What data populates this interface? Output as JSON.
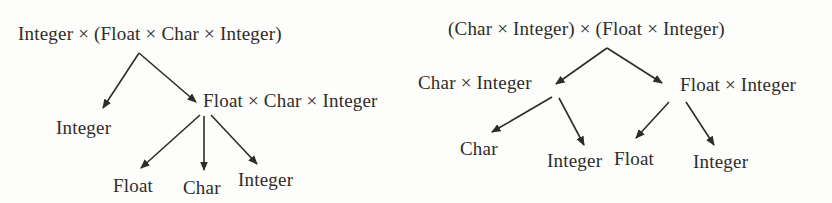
{
  "colors": {
    "ink": "#2e2c29",
    "background": "#fdfdfb"
  },
  "left_tree": {
    "root": "Integer × (Float × Char × Integer)",
    "left_child": "Integer",
    "right_child": "Float × Char × Integer",
    "grandchildren": [
      "Float",
      "Char",
      "Integer"
    ]
  },
  "right_tree": {
    "root": "(Char × Integer) × (Float × Integer)",
    "left_child": "Char × Integer",
    "right_child": "Float × Integer",
    "left_grandchildren": [
      "Char",
      "Integer"
    ],
    "right_grandchildren": [
      "Float",
      "Integer"
    ]
  }
}
